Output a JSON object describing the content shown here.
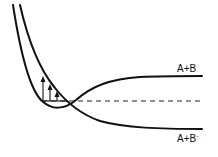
{
  "diagram": {
    "type": "potential-energy-curves",
    "labels": {
      "upper_asymptote": "A+B",
      "lower_asymptote_base": "A+B",
      "lower_asymptote_sup": "-"
    },
    "curves": [
      {
        "name": "neutral-curve",
        "asymptote_label": "A+B"
      },
      {
        "name": "anion-curve",
        "asymptote_label": "A+B-"
      }
    ],
    "vibrational_arrows": 3,
    "dashed_reference_line": true,
    "colors": {
      "line": "#111111",
      "background": "#ffffff"
    }
  }
}
